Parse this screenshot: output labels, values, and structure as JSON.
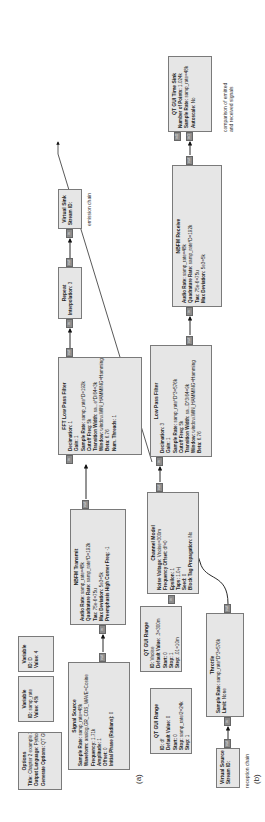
{
  "figure": {
    "panel_a_label": "(a)",
    "panel_b_label": "(b)",
    "emission_note": "emission chain",
    "reception_note": "reception chain",
    "comparison_note_line1": "comparison of emitted",
    "comparison_note_line2": "and received signals"
  },
  "blocks": {
    "options": {
      "title": "Options",
      "params": [
        {
          "k": "Title:",
          "v": "Chapter 2 example 3"
        },
        {
          "k": "Output Language:",
          "v": "Python"
        },
        {
          "k": "Generate Options:",
          "v": "QT GUI"
        }
      ]
    },
    "variable_samp_rate": {
      "title": "Variable",
      "params": [
        {
          "k": "ID:",
          "v": "samp_rate"
        },
        {
          "k": "Value:",
          "v": "48k"
        }
      ]
    },
    "variable_d": {
      "title": "Variable",
      "params": [
        {
          "k": "ID:",
          "v": "D"
        },
        {
          "k": "Value:",
          "v": "4"
        }
      ]
    },
    "signal_source": {
      "title": "Signal Source",
      "params": [
        {
          "k": "Sample Rate:",
          "v": "samp_rate=48k"
        },
        {
          "k": "Waveform:",
          "v": "analog.GR_COS_WAVE=Cosine"
        },
        {
          "k": "Frequency:",
          "v": "1.71k"
        },
        {
          "k": "Amplitude:",
          "v": "1"
        },
        {
          "k": "Offset:",
          "v": "0"
        },
        {
          "k": "Initial Phase (Radians):",
          "v": "0"
        }
      ],
      "port_out": "out"
    },
    "nbfm_transmit": {
      "title": "NBFM Transmit",
      "params": [
        {
          "k": "Audio Rate:",
          "v": "samp_rate=48k"
        },
        {
          "k": "Quadrature Rate:",
          "v": "samp_rate*D=192k"
        },
        {
          "k": "Tau:",
          "v": "75e-6=75u"
        },
        {
          "k": "Max Deviation:",
          "v": "5e3=5k"
        },
        {
          "k": "Preemphasis High Corner Freq:",
          "v": "-1"
        }
      ],
      "port_in": "in",
      "port_out": "out"
    },
    "fft_low_pass_filter": {
      "title": "FFT Low Pass Filter",
      "params": [
        {
          "k": "Decimation:",
          "v": "1"
        },
        {
          "k": "Gain:",
          "v": "1"
        },
        {
          "k": "Sample Rate:",
          "v": "samp_rate*D=192k"
        },
        {
          "k": "Cutoff Freq:",
          "v": "5k"
        },
        {
          "k": "Transition Width:",
          "v": "sa...e*D/64=3k"
        },
        {
          "k": "Window:",
          "v": "window.WIN_HAMMING=Hamming"
        },
        {
          "k": "Beta:",
          "v": "6.76"
        },
        {
          "k": "Num. Threads:",
          "v": "1"
        }
      ],
      "port_in": "in",
      "port_out": "out"
    },
    "repeat": {
      "title": "Repeat",
      "params": [
        {
          "k": "Interpolation:",
          "v": "3"
        }
      ],
      "port_in": "in",
      "port_out": "out"
    },
    "virtual_sink": {
      "title": "Virtual Sink",
      "params": [
        {
          "k": "Stream ID:",
          "v": ""
        }
      ],
      "port_in": "in"
    },
    "qt_gui_range_df": {
      "title": "QT GUI Range",
      "params": [
        {
          "k": "ID:",
          "v": "df"
        },
        {
          "k": "Default Value:",
          "v": "0"
        },
        {
          "k": "Start:",
          "v": "0"
        },
        {
          "k": "Stop:",
          "v": "samp_rate/2=24k"
        },
        {
          "k": "Step:",
          "v": "1"
        }
      ]
    },
    "qt_gui_range_vnoise": {
      "title": "QT GUI Range",
      "params": [
        {
          "k": "ID:",
          "v": "Vnoise"
        },
        {
          "k": "Default Value:",
          "v": ".3=300m"
        },
        {
          "k": "Start:",
          "v": "0"
        },
        {
          "k": "Stop:",
          "v": "1"
        },
        {
          "k": "Step:",
          "v": ".01=10m"
        }
      ]
    },
    "channel_model": {
      "title": "Channel Model",
      "params": [
        {
          "k": "Noise Voltage:",
          "v": "Vnoise=300m"
        },
        {
          "k": "Frequency Offset:",
          "v": "df=0"
        },
        {
          "k": "Epsilon:",
          "v": "1"
        },
        {
          "k": "Taps:",
          "v": "1.0+j"
        },
        {
          "k": "Seed:",
          "v": "0"
        },
        {
          "k": "Block Tag Propagation:",
          "v": "No"
        }
      ],
      "port_in": "in",
      "port_out": "out"
    },
    "low_pass_filter": {
      "title": "Low Pass Filter",
      "params": [
        {
          "k": "Decimation:",
          "v": "3"
        },
        {
          "k": "Gain:",
          "v": "1"
        },
        {
          "k": "Sample Rate:",
          "v": "samp_rate*D*3=576k"
        },
        {
          "k": "Cutoff Freq:",
          "v": "5k"
        },
        {
          "k": "Transition Width:",
          "v": "sa...D*3/64=9k"
        },
        {
          "k": "Window:",
          "v": "window.WIN_HAMMING=Hamming"
        },
        {
          "k": "Beta:",
          "v": "6.76"
        }
      ],
      "port_in": "in",
      "port_out": "out"
    },
    "nbfm_receive": {
      "title": "NBFM Receive",
      "params": [
        {
          "k": "Audio Rate:",
          "v": "samp_rate=48k"
        },
        {
          "k": "Quadrature Rate:",
          "v": "samp_rate*D=192k"
        },
        {
          "k": "Tau:",
          "v": "75e-6=75u"
        },
        {
          "k": "Max Deviation:",
          "v": "5e3=5k"
        }
      ],
      "port_in": "in",
      "port_out": "out"
    },
    "qt_gui_time_sink": {
      "title": "QT GUI Time Sink",
      "params": [
        {
          "k": "Number of Points:",
          "v": "1.024k"
        },
        {
          "k": "Sample Rate:",
          "v": "samp_rate=48k"
        },
        {
          "k": "Autoscale:",
          "v": "No"
        }
      ],
      "port_in0": "in0",
      "port_in1": "in1"
    },
    "virtual_source": {
      "title": "Virtual Source",
      "params": [
        {
          "k": "Stream ID:",
          "v": ""
        }
      ],
      "port_out": "out"
    },
    "throttle": {
      "title": "Throttle",
      "params": [
        {
          "k": "Sample Rate:",
          "v": "samp_rate*D*3=576k"
        },
        {
          "k": "Limit:",
          "v": "None"
        }
      ],
      "port_in": "in",
      "port_out": "out"
    }
  },
  "colors": {
    "block_fill": "#e6e6e6",
    "block_border": "#7a7a7a",
    "port_fill": "#8c8c8c",
    "wire": "#111111"
  }
}
